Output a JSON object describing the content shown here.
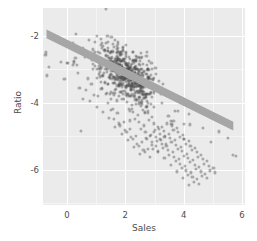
{
  "chart_data": {
    "type": "scatter",
    "title": "",
    "xlabel": "Sales",
    "ylabel": "Ratio",
    "xlim": [
      -0.82,
      6.1
    ],
    "ylim": [
      -7.05,
      -1.18
    ],
    "xticks": [
      0,
      2,
      4,
      6
    ],
    "xticklabels": [
      "0",
      "2",
      "4",
      "6"
    ],
    "yticks": [
      -2,
      -4,
      -6
    ],
    "yticklabels": [
      "-2",
      "-4",
      "-6"
    ],
    "grid": true,
    "grid_color": "#ffffff",
    "panel_background": "#ebebeb",
    "point_color": "#4d4d4d",
    "point_opacity": 0.42,
    "point_size": 3.1,
    "legend": "none",
    "trendline": {
      "type": "linear-fit-band",
      "color": "#a6a6a6",
      "x_start": -0.7,
      "y_start": -1.95,
      "x_end": 5.7,
      "y_end": -4.7,
      "band_halfwidth": 0.13
    },
    "n_points": 712,
    "series": [
      {
        "name": "observations",
        "x": [
          1.34,
          -0.56,
          0.22,
          0.55,
          0.91,
          0.3,
          0.74,
          1.05,
          0.43,
          0.86,
          1.18,
          0.62,
          0.38,
          1.42,
          0.95,
          1.27,
          0.71,
          0.49,
          1.61,
          1.09,
          0.84,
          1.33,
          0.66,
          1.52,
          1.21,
          0.93,
          1.7,
          1.44,
          1.12,
          0.79,
          1.86,
          1.58,
          1.3,
          1.02,
          1.75,
          1.47,
          1.19,
          1.91,
          1.63,
          1.36,
          2.08,
          1.8,
          1.52,
          1.24,
          1.97,
          1.69,
          1.41,
          2.13,
          1.85,
          1.57,
          2.29,
          2.01,
          1.73,
          1.45,
          2.18,
          1.9,
          1.62,
          2.34,
          2.06,
          1.78,
          2.5,
          2.22,
          1.94,
          1.66,
          2.39,
          2.11,
          1.83,
          2.55,
          2.27,
          1.99,
          2.71,
          2.43,
          2.15,
          1.87,
          2.6,
          2.32,
          2.04,
          2.76,
          2.48,
          2.2,
          2.92,
          2.64,
          2.36,
          2.08,
          2.81,
          2.53,
          2.25,
          2.97,
          2.69,
          2.41,
          3.13,
          2.85,
          2.57,
          2.29,
          3.02,
          2.74,
          2.46,
          3.18,
          2.9,
          2.62,
          3.34,
          3.06,
          2.78,
          2.5,
          3.23,
          2.95,
          2.67,
          3.39,
          3.11,
          2.83,
          3.55,
          3.27,
          2.99,
          2.71,
          3.44,
          3.16,
          2.88,
          3.6,
          3.32,
          3.04,
          3.76,
          3.48,
          3.2,
          2.92,
          3.65,
          3.37,
          3.09,
          3.81,
          3.53,
          3.25,
          3.97,
          3.69,
          3.41,
          3.13,
          3.86,
          3.58,
          3.3,
          4.02,
          3.74,
          3.46,
          4.18,
          3.9,
          3.62,
          3.34,
          4.07,
          3.79,
          3.51,
          4.23,
          3.95,
          3.67,
          4.39,
          4.11,
          3.83,
          3.55,
          4.28,
          4.0,
          3.72,
          4.44,
          4.16,
          3.88,
          4.6,
          4.32,
          4.04,
          3.76,
          4.49,
          4.21,
          3.93,
          4.65,
          4.37,
          4.09,
          4.81,
          4.53,
          4.25,
          3.97,
          4.7,
          4.42,
          4.14,
          4.86,
          4.58,
          4.3,
          5.02,
          4.74,
          4.46,
          4.18,
          4.91,
          4.63,
          4.35,
          5.07,
          4.79,
          4.51
        ],
        "y": [
          -1.22,
          -2.05,
          -2.22,
          -2.38,
          -2.55,
          -1.95,
          -2.12,
          -2.48,
          -3.55,
          -2.72,
          -2.28,
          -2.65,
          -3.12,
          -2.18,
          -2.92,
          -2.42,
          -3.28,
          -4.85,
          -2.35,
          -2.82,
          -3.45,
          -2.58,
          -3.62,
          -2.48,
          -2.95,
          -3.78,
          -2.62,
          -2.88,
          -3.22,
          -3.95,
          -2.75,
          -3.05,
          -3.38,
          -4.12,
          -2.92,
          -3.18,
          -3.55,
          -3.08,
          -3.32,
          -3.72,
          -3.15,
          -3.45,
          -3.88,
          -4.28,
          -3.28,
          -3.58,
          -4.02,
          -3.42,
          -3.68,
          -4.18,
          -3.52,
          -3.78,
          -4.32,
          -4.45,
          -3.62,
          -3.88,
          -4.48,
          -3.72,
          -3.98,
          -4.62,
          -3.82,
          -4.08,
          -4.58,
          -4.72,
          -3.92,
          -4.18,
          -4.68,
          -4.02,
          -4.28,
          -4.82,
          -4.12,
          -4.38,
          -4.78,
          -4.92,
          -4.22,
          -4.48,
          -4.88,
          -4.32,
          -4.58,
          -5.02,
          -4.42,
          -4.68,
          -4.98,
          -5.12,
          -4.52,
          -4.78,
          -5.08,
          -4.62,
          -4.88,
          -5.22,
          -4.72,
          -4.98,
          -5.18,
          -5.32,
          -4.82,
          -5.08,
          -5.28,
          -4.92,
          -5.18,
          -5.42,
          -5.02,
          -5.28,
          -5.38,
          -5.52,
          -5.12,
          -5.38,
          -5.48,
          -5.22,
          -5.48,
          -5.62,
          -4.55,
          -4.72,
          -4.88,
          -5.05,
          -4.62,
          -4.78,
          -4.95,
          -4.68,
          -4.85,
          -5.02,
          -4.75,
          -4.92,
          -5.08,
          -5.25,
          -4.82,
          -4.98,
          -5.15,
          -4.88,
          -5.05,
          -5.22,
          -4.95,
          -5.12,
          -5.28,
          -5.45,
          -5.02,
          -5.18,
          -5.35,
          -5.08,
          -5.25,
          -5.42,
          -5.15,
          -5.32,
          -5.48,
          -5.65,
          -5.22,
          -5.38,
          -5.55,
          -5.28,
          -5.45,
          -5.62,
          -5.35,
          -5.52,
          -5.68,
          -5.85,
          -5.42,
          -5.58,
          -5.75,
          -5.48,
          -5.65,
          -5.82,
          -5.55,
          -5.72,
          -5.88,
          -6.05,
          -5.62,
          -5.78,
          -5.95,
          -5.68,
          -5.85,
          -6.02,
          -5.75,
          -5.92,
          -6.08,
          -6.25,
          -5.82,
          -5.98,
          -6.15,
          -5.88,
          -6.05,
          -6.22,
          -5.95,
          -6.12,
          -6.28,
          -6.45,
          -6.02,
          -6.18,
          -6.35,
          -6.08,
          -6.25,
          -6.42
        ]
      }
    ]
  }
}
